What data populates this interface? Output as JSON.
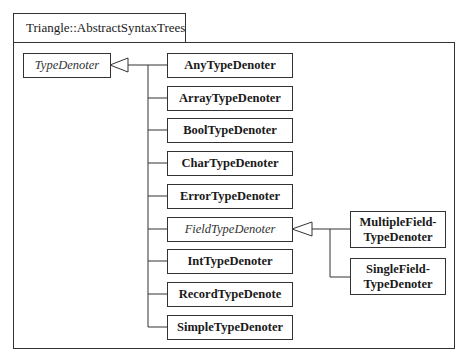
{
  "package": {
    "name": "Triangle::AbstractSyntaxTrees"
  },
  "root_class": {
    "name": "TypeDenoter",
    "abstract": true
  },
  "subclasses": [
    {
      "name": "AnyTypeDenoter",
      "abstract": false
    },
    {
      "name": "ArrayTypeDenoter",
      "abstract": false
    },
    {
      "name": "BoolTypeDenoter",
      "abstract": false
    },
    {
      "name": "CharTypeDenoter",
      "abstract": false
    },
    {
      "name": "ErrorTypeDenoter",
      "abstract": false
    },
    {
      "name": "FieldTypeDenoter",
      "abstract": true
    },
    {
      "name": "IntTypeDenoter",
      "abstract": false
    },
    {
      "name": "RecordTypeDenote",
      "abstract": false
    },
    {
      "name": "SimpleTypeDenoter",
      "abstract": false
    }
  ],
  "field_subclasses": [
    {
      "line1": "MultipleField-",
      "line2": "TypeDenoter"
    },
    {
      "line1": "SingleField-",
      "line2": "TypeDenoter"
    }
  ],
  "colors": {
    "line": "#333333",
    "background": "#ffffff"
  }
}
